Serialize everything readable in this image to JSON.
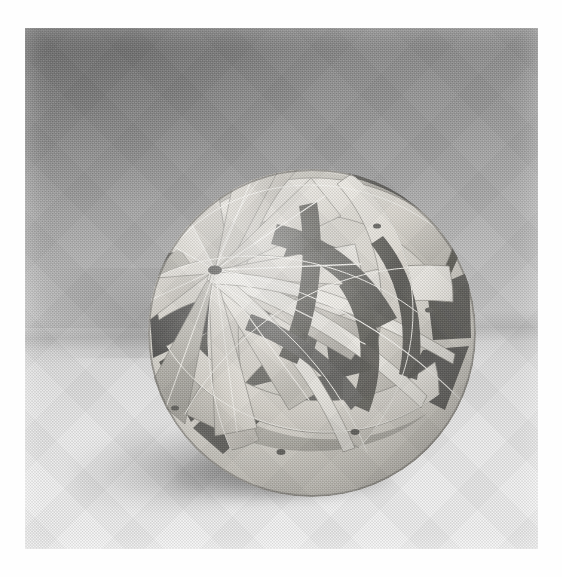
{
  "page": {
    "kind": "halftone-photograph",
    "subject_title": "Woven paper geometric sphere sculpture",
    "caption": "",
    "plate": {
      "left_px": 25,
      "top_px": 28,
      "width_px": 513,
      "height_px": 521,
      "margin_color": "#ffffff"
    }
  },
  "scene": {
    "description": "Black-and-white studio photograph of a modular woven-paper polyhedral sphere resting on a pale tabletop in front of a graduated backdrop.",
    "backdrop": {
      "name": "graduated studio backdrop",
      "top_color": "#8f8f8f",
      "bottom_color": "#eaeaea",
      "darkest_corner": "upper-left"
    },
    "tabletop": {
      "name": "pale table surface",
      "color": "#ececec",
      "horizon_y_px": 300
    },
    "shadow": {
      "name": "soft cast shadow",
      "direction": "lower-left",
      "color": "#5a5a5a",
      "opacity": 0.55
    }
  },
  "sculpture": {
    "name": "woven sphere model",
    "material": "white card stock strips",
    "center_x_px": 287,
    "center_y_px": 305,
    "radius_px": 163,
    "paper_light": "#eeece6",
    "paper_mid": "#cdcac2",
    "paper_shade": "#9c9a93",
    "interior_dark": "#3a3a38",
    "interior_darkest": "#242423",
    "edge_line": "#6d6b66",
    "hub_vertex": {
      "x_px": 190,
      "y_px": 242,
      "label": "front convergence hub"
    },
    "vertices": [
      {
        "name": "top-vertex",
        "x_px": 273,
        "y_px": 112
      },
      {
        "name": "front-hub-vertex",
        "x_px": 190,
        "y_px": 242
      },
      {
        "name": "upper-right-vertex",
        "x_px": 352,
        "y_px": 198
      },
      {
        "name": "right-vertex",
        "x_px": 404,
        "y_px": 282
      },
      {
        "name": "lower-right-vertex",
        "x_px": 330,
        "y_px": 404
      },
      {
        "name": "bottom-vertex",
        "x_px": 256,
        "y_px": 424
      },
      {
        "name": "lower-left-vertex",
        "x_px": 150,
        "y_px": 380
      },
      {
        "name": "left-vertex",
        "x_px": 112,
        "y_px": 270
      }
    ],
    "features": [
      "great-circle paper bands woven over and under one another",
      "radiating flat triangular petals meeting at the front hub",
      "dark shaded openings revealing the hollow interior",
      "thin bright highlight lines along folded card edges"
    ]
  },
  "print": {
    "name": "offset halftone screen",
    "screen_angle_deg": 45,
    "grain": "visible dot screen over entire plate"
  }
}
